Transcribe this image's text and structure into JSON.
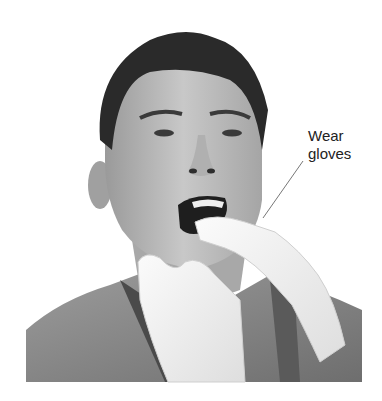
{
  "figure": {
    "callout": {
      "line1": "Wear",
      "line2": "gloves"
    },
    "colors": {
      "background": "#ffffff",
      "text": "#222222",
      "glove": "#f2f2f2",
      "shirt": "#8a8a8a",
      "skin": "#bdbdbd",
      "hair": "#2a2a2a"
    }
  }
}
